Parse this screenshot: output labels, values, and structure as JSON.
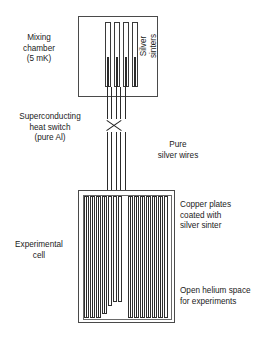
{
  "figure": {
    "background_color": "#ffffff",
    "line_color": "#2b2b2b"
  },
  "labels": {
    "mixing_chamber": "Mixing\nchamber\n(5 mK)",
    "silver_sinters": "Silver\nsinters",
    "superconducting_switch": "Superconducting\nheat switch\n(pure Al)",
    "pure_silver_wires": "Pure\nsilver wires",
    "experimental_cell": "Experimental\ncell",
    "copper_plates": "Copper plates\ncoated with\nsilver sinter",
    "open_helium_space": "Open helium space\nfor experiments"
  },
  "components": {
    "mixing_chamber": {
      "name": "mixing-chamber",
      "temperature": "5 mK",
      "sinter_rod_count": 4,
      "rod_positions_px": [
        105,
        114,
        123,
        132
      ],
      "rod_top_px": 22,
      "rod_height_px": 65,
      "core_start_offset_px": 35
    },
    "heat_switch": {
      "name": "superconducting-heat-switch",
      "material": "pure Al",
      "symbol": "X"
    },
    "silver_wires": {
      "name": "pure-silver-wires",
      "count": 5,
      "x_positions_px": [
        106,
        110,
        114,
        118,
        122
      ],
      "upper_span_px": [
        97,
        119
      ],
      "lower_span_px": [
        132,
        192
      ]
    },
    "experimental_cell": {
      "name": "experimental-cell",
      "plate_groups": [
        {
          "group": "left",
          "plates": [
            {
              "x": 84,
              "w": 5,
              "top": 196,
              "h": 122
            },
            {
              "x": 90,
              "w": 5,
              "top": 196,
              "h": 122
            },
            {
              "x": 96,
              "w": 5,
              "top": 196,
              "h": 122
            },
            {
              "x": 102,
              "w": 5,
              "top": 196,
              "h": 118
            },
            {
              "x": 108,
              "w": 4,
              "top": 196,
              "h": 110
            }
          ]
        },
        {
          "group": "center",
          "plates": [
            {
              "x": 113,
              "w": 4,
              "top": 196,
              "h": 106
            },
            {
              "x": 118,
              "w": 4,
              "top": 196,
              "h": 106
            }
          ]
        },
        {
          "group": "right",
          "plates": [
            {
              "x": 128,
              "w": 5,
              "top": 196,
              "h": 122
            },
            {
              "x": 134,
              "w": 5,
              "top": 196,
              "h": 122
            },
            {
              "x": 140,
              "w": 5,
              "top": 196,
              "h": 122
            },
            {
              "x": 146,
              "w": 5,
              "top": 196,
              "h": 122
            },
            {
              "x": 152,
              "w": 5,
              "top": 196,
              "h": 122
            },
            {
              "x": 158,
              "w": 5,
              "top": 196,
              "h": 122
            },
            {
              "x": 164,
              "w": 4,
              "top": 196,
              "h": 122
            }
          ]
        }
      ]
    }
  }
}
